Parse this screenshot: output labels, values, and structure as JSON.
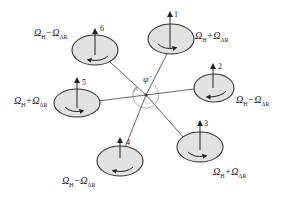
{
  "figure": {
    "center_label": "ψ̈",
    "colors": {
      "rotor_fill": "#e2e2e2",
      "rotor_stroke": "#333333",
      "arm": "#555555",
      "arc": "#888888"
    }
  },
  "rotors": [
    {
      "id": "1",
      "speed_label": "ΩH+ΩΔR",
      "sign": "+",
      "spin": "ccw"
    },
    {
      "id": "2",
      "speed_label": "ΩH−ΩΔR",
      "sign": "−",
      "spin": "cw"
    },
    {
      "id": "3",
      "speed_label": "ΩH+ΩΔR",
      "sign": "+",
      "spin": "ccw"
    },
    {
      "id": "4",
      "speed_label": "ΩH−ΩΔR",
      "sign": "−",
      "spin": "cw"
    },
    {
      "id": "5",
      "speed_label": "ΩH+ΩΔR",
      "sign": "+",
      "spin": "ccw"
    },
    {
      "id": "6",
      "speed_label": "ΩH−ΩΔR",
      "sign": "−",
      "spin": "cw"
    }
  ],
  "labels": {
    "omega": "Ω",
    "H": "H",
    "delta_R": "ΔR",
    "plus": "+",
    "minus": "−"
  }
}
